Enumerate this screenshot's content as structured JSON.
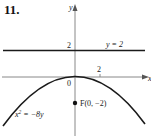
{
  "problem": {
    "number": "11."
  },
  "axes": {
    "x_label": "x",
    "y_label": "y",
    "origin_label": "0",
    "x_tick_label": "2",
    "y_tick_label": "2"
  },
  "directrix": {
    "label": "y = 2",
    "equation_y": 2
  },
  "parabola": {
    "label_base": "x",
    "label_exp": "2",
    "label_rest": " = −8y",
    "equation": "x^2 = -8y"
  },
  "focus": {
    "label": "F(0, −2)",
    "x": 0,
    "y": -2
  },
  "colors": {
    "curve": "#1a1a1a",
    "axis": "#888888",
    "directrix": "#1a1a1a"
  }
}
